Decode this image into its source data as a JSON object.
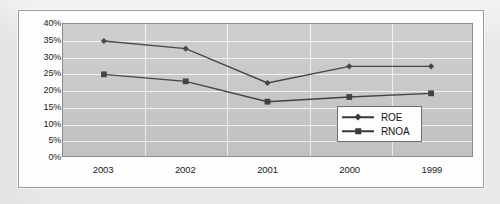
{
  "chart_data": {
    "type": "line",
    "title": "",
    "subtitle": "",
    "xlabel": "",
    "ylabel": "",
    "categories": [
      "2003",
      "2002",
      "2001",
      "2000",
      "1999"
    ],
    "series": [
      {
        "name": "ROE",
        "marker": "diamond",
        "values": [
          34.9,
          32.6,
          22.3,
          27.3,
          27.3
        ]
      },
      {
        "name": "RNOA",
        "marker": "square",
        "values": [
          24.9,
          22.8,
          16.7,
          18.1,
          19.2
        ]
      }
    ],
    "ytick_labels": [
      "40%",
      "35%",
      "30%",
      "25%",
      "20%",
      "15%",
      "10%",
      "5%",
      "0%"
    ],
    "ytick_values": [
      40,
      35,
      30,
      25,
      20,
      15,
      10,
      5,
      0
    ],
    "ylim": [
      0,
      40
    ],
    "ytick_step": 5,
    "value_suffix": "%",
    "grid": true,
    "grid_axis": "both",
    "legend_position": "bottom-right",
    "plot_background": "#c9c9c9",
    "grid_color": "#f4f4f4",
    "line_color": "#3a3a3a",
    "marker_color": "#3a3a3a",
    "axis_text_color": "#1b1b1b"
  },
  "legend": {
    "items": [
      {
        "label": "ROE",
        "marker": "diamond"
      },
      {
        "label": "RNOA",
        "marker": "square"
      }
    ]
  }
}
